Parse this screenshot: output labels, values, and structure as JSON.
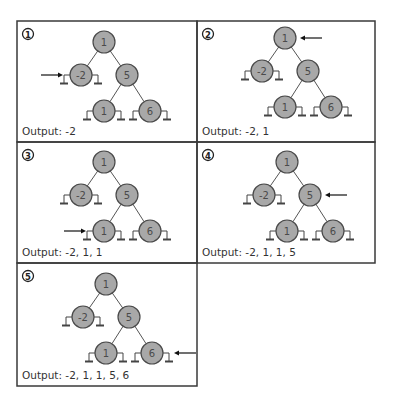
{
  "diagram": {
    "type": "in-order binary tree traversal (step-by-step)",
    "colors": {
      "node_fill": "#a8a8a8",
      "node_stroke": "#4a4a4a",
      "border": "#3a3a3a",
      "arrow": "#111111"
    },
    "tree": {
      "nodes": [
        {
          "id": "root",
          "value": "1",
          "dx": 0,
          "dy": 0
        },
        {
          "id": "left",
          "value": "-2",
          "dx": -23,
          "dy": 33,
          "parent": "root",
          "null_left": true,
          "null_right": true
        },
        {
          "id": "right",
          "value": "5",
          "dx": 23,
          "dy": 33,
          "parent": "root"
        },
        {
          "id": "right-left",
          "value": "1",
          "dx": 0,
          "dy": 69,
          "parent": "right",
          "null_left": true,
          "null_right": true
        },
        {
          "id": "right-right",
          "value": "6",
          "dx": 46,
          "dy": 69,
          "parent": "right",
          "null_left": true,
          "null_right": true
        }
      ]
    },
    "panels": [
      {
        "step": "1",
        "badge": "①",
        "rect": {
          "x": 17,
          "y": 21,
          "w": 180,
          "h": 121
        },
        "root": {
          "x": 104,
          "y": 42
        },
        "arrow": {
          "target": "left",
          "side": "left",
          "direction": "right"
        },
        "output": "Output: -2"
      },
      {
        "step": "2",
        "badge": "②",
        "rect": {
          "x": 197,
          "y": 21,
          "w": 178,
          "h": 121
        },
        "root": {
          "x": 285,
          "y": 38
        },
        "arrow": {
          "target": "root",
          "side": "right",
          "direction": "left"
        },
        "output": "Output: -2, 1"
      },
      {
        "step": "3",
        "badge": "③",
        "rect": {
          "x": 17,
          "y": 142,
          "w": 180,
          "h": 121
        },
        "root": {
          "x": 104,
          "y": 162
        },
        "arrow": {
          "target": "right-left",
          "side": "left",
          "direction": "right"
        },
        "output": "Output: -2, 1, 1"
      },
      {
        "step": "4",
        "badge": "④",
        "rect": {
          "x": 197,
          "y": 142,
          "w": 178,
          "h": 121
        },
        "root": {
          "x": 287,
          "y": 162
        },
        "arrow": {
          "target": "right",
          "side": "right",
          "direction": "left"
        },
        "output": "Output: -2, 1, 1, 5"
      },
      {
        "step": "5",
        "badge": "⑤",
        "rect": {
          "x": 17,
          "y": 263,
          "w": 180,
          "h": 123
        },
        "root": {
          "x": 106,
          "y": 284
        },
        "arrow": {
          "target": "right-right",
          "side": "right",
          "direction": "left"
        },
        "output": "Output: -2, 1, 1, 5, 6"
      }
    ]
  }
}
